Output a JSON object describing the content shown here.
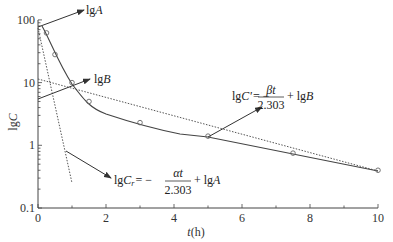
{
  "chart_data": {
    "type": "scatter",
    "title": "",
    "xlabel_var": "t",
    "xlabel_unit": "(h)",
    "ylabel_prefix": "lg",
    "ylabel_var": "C",
    "yscale": "log",
    "xlim": [
      0,
      10
    ],
    "ylim": [
      0.1,
      100
    ],
    "x_ticks": [
      "0",
      "2",
      "4",
      "6",
      "8",
      "10"
    ],
    "y_ticks": [
      "0.1",
      "1",
      "10",
      "100"
    ],
    "grid": false,
    "series": [
      {
        "name": "observed concentration",
        "kind": "points+curve",
        "x": [
          0.25,
          0.5,
          1.0,
          1.5,
          3.0,
          5.0,
          7.5,
          10.0
        ],
        "y": [
          62,
          28,
          10,
          5.0,
          2.3,
          1.4,
          0.75,
          0.4
        ]
      },
      {
        "name": "terminal phase extrapolation (lgC' = -βt/2.303 + lgB)",
        "kind": "dotted-line",
        "x": [
          0,
          10
        ],
        "y": [
          4.5,
          0.4
        ]
      },
      {
        "name": "residual line (lgCr = -αt/2.303 + lgA)",
        "kind": "dotted-line",
        "x": [
          0,
          1.0
        ],
        "y": [
          70,
          0.25
        ]
      }
    ],
    "annotations": [
      {
        "text": "lgA",
        "target": "y-intercept of residual line (~70)"
      },
      {
        "text": "lgB",
        "target": "y-intercept of terminal line (~4.5)"
      },
      {
        "text": "lgC' = -βt/2.303 + lgB",
        "target": "terminal line at t=5"
      },
      {
        "text": "lgCr = -αt/2.303 + lgA",
        "target": "residual line near t=0.8"
      }
    ]
  },
  "labels": {
    "y_tick_100": "100",
    "y_tick_10": "10",
    "y_tick_1": "1",
    "y_tick_01": "0.1",
    "x_tick_0": "0",
    "x_tick_2": "2",
    "x_tick_4": "4",
    "x_tick_6": "6",
    "x_tick_8": "8",
    "x_tick_10": "10",
    "xlabel_var": "t",
    "xlabel_unit": "(h)",
    "ylabel_lg": "lg",
    "ylabel_var": "C",
    "ann_lgA_lg": "lg",
    "ann_lgA_var": "A",
    "ann_lgB_lg": "lg",
    "ann_lgB_var": "B",
    "eqB_lhs_lg": "lg",
    "eqB_lhs_var": "C'",
    "eqB_eq": "= −",
    "eqB_num": "βt",
    "eqB_den": "2.303",
    "eqB_plus": "+ lg",
    "eqB_var": "B",
    "eqA_lhs_lg": "lg",
    "eqA_lhs_var": "C",
    "eqA_sub": "r",
    "eqA_eq": "= −",
    "eqA_num": "αt",
    "eqA_den": "2.303",
    "eqA_plus": "+ lg",
    "eqA_var": "A"
  }
}
